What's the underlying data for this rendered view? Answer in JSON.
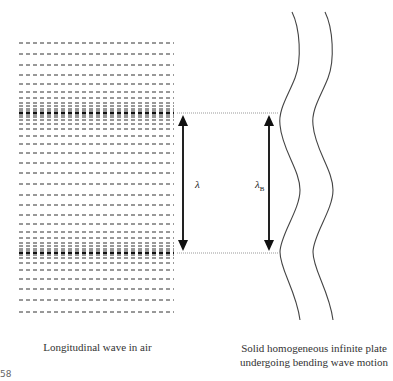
{
  "figure": {
    "left_caption": "Longitudinal wave in air",
    "right_caption_line1": "Solid homogeneous infinite plate",
    "right_caption_line2": "undergoing bending wave motion",
    "lambda_label": "λ",
    "lambda_b_label": "λ",
    "lambda_b_sub": "B",
    "corner_text": "58"
  },
  "air_lines_y": [
    43,
    54,
    65,
    75,
    84,
    92,
    98,
    103,
    106,
    109,
    111,
    113,
    115,
    117,
    120,
    124,
    129,
    136,
    144,
    153,
    163,
    173,
    184,
    195,
    205,
    215,
    224,
    232,
    238,
    243,
    246,
    249,
    251,
    253,
    255,
    258,
    263,
    270,
    279,
    289,
    300,
    312
  ],
  "bold_lines_y": [
    113,
    253
  ],
  "colors": {
    "line": "#333333",
    "dotted": "#999999",
    "arrow": "#111111"
  }
}
